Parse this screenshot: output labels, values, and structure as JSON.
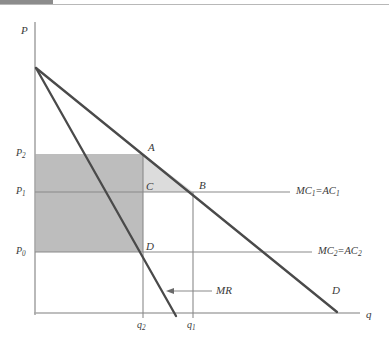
{
  "figure": {
    "kind": "economics-diagram",
    "title_bar_present": true,
    "axes": {
      "y_label": "P",
      "x_label": "q",
      "origin_px": [
        35,
        313
      ],
      "y_top_px": 22,
      "x_right_px": 360
    },
    "colors": {
      "curve": "#4a4a4a",
      "axis": "#a8a8a8",
      "cost_line": "#8a8a8a",
      "profit_rect_fill": "#bdbdbd",
      "triangle_fill": "#dcdcdc",
      "text": "#3a3a3a",
      "top_bar": "#8c8c8c",
      "background": "#ffffff"
    },
    "price_ticks": [
      {
        "id": "P2",
        "base": "P",
        "sub": "2",
        "y_px": 154
      },
      {
        "id": "P1",
        "base": "P",
        "sub": "1",
        "y_px": 192
      },
      {
        "id": "P0",
        "base": "P",
        "sub": "0",
        "y_px": 252
      }
    ],
    "quantity_ticks": [
      {
        "id": "q2",
        "base": "q",
        "sub": "2",
        "x_px": 143
      },
      {
        "id": "q1",
        "base": "q",
        "sub": "1",
        "x_px": 193
      }
    ],
    "points": [
      {
        "id": "A",
        "label": "A",
        "x_px": 143,
        "y_px": 154,
        "label_x": 148,
        "label_y": 144
      },
      {
        "id": "B",
        "label": "B",
        "x_px": 193,
        "y_px": 192,
        "label_x": 198,
        "label_y": 182
      },
      {
        "id": "C",
        "label": "C",
        "x_px": 143,
        "y_px": 192,
        "label_x": 146,
        "label_y": 182
      },
      {
        "id": "D",
        "label": "D",
        "x_px": 143,
        "y_px": 252,
        "label_x": 146,
        "label_y": 243
      }
    ],
    "curves": [
      {
        "id": "demand",
        "label": "D",
        "label_x": 333,
        "label_y": 288,
        "from_px": [
          36,
          68
        ],
        "to_px": [
          337,
          312
        ]
      },
      {
        "id": "marginal-revenue",
        "label": "MR",
        "label_x": 218,
        "label_y": 288,
        "from_px": [
          36,
          68
        ],
        "to_px": [
          176,
          313
        ]
      }
    ],
    "cost_lines": [
      {
        "id": "mc1",
        "label_parts": [
          "MC",
          "1",
          "=",
          "AC",
          "1"
        ],
        "label_text": "MC1 = AC1",
        "y_px": 192,
        "from_x_px": 35,
        "to_x_px": 290,
        "label_x": 297,
        "label_y": 187
      },
      {
        "id": "mc2",
        "label_parts": [
          "MC",
          "2",
          "=",
          "AC",
          "2"
        ],
        "label_text": "MC2 = AC2",
        "y_px": 252,
        "from_x_px": 35,
        "to_x_px": 312,
        "label_x": 318,
        "label_y": 247
      }
    ],
    "annotations": [
      {
        "id": "mr-pointer",
        "label": "MR",
        "arrow_from_px": [
          212,
          291
        ],
        "arrow_to_px": [
          170,
          291
        ]
      }
    ],
    "shaded_regions": [
      {
        "id": "profit-rectangle",
        "fill": "#bdbdbd",
        "description": "rectangle P0 P2 A-column to q2",
        "x0_px": 35,
        "y0_px": 154,
        "x1_px": 143,
        "y1_px": 252
      },
      {
        "id": "deadweight-triangle-ACB",
        "fill": "#dcdcdc",
        "description": "triangle A C B",
        "points_px": [
          [
            143,
            154
          ],
          [
            143,
            192
          ],
          [
            193,
            192
          ]
        ]
      }
    ],
    "guide_lines": [
      {
        "id": "q2-vertical",
        "x_px": 143,
        "y_top_px": 154,
        "y_bottom_px": 318
      },
      {
        "id": "q1-vertical",
        "x_px": 193,
        "y_top_px": 192,
        "y_bottom_px": 318
      }
    ]
  }
}
